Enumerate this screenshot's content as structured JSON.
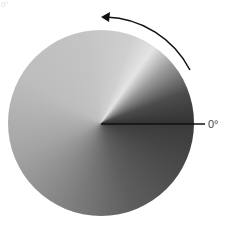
{
  "diagram": {
    "type": "angular-gradient-disc",
    "zero_label": "0°",
    "corner_label": "0°",
    "rotation_direction": "counter-clockwise",
    "colors": {
      "dark": "#333333",
      "light": "#e4e4e4",
      "line": "#111111",
      "arrow": "#111111"
    }
  }
}
